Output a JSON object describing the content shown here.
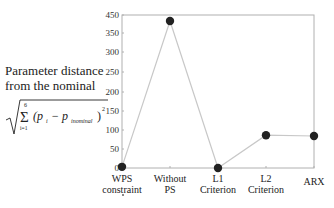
{
  "chart_data": {
    "type": "line",
    "title": "",
    "ylabel_line1": "Parameter distance",
    "ylabel_line2": "from the nominal",
    "ylabel_formula": "sqrt( sum_{i=1}^{6} (p_i - p_{i nominal})^2 )",
    "formula_parts": {
      "sum_top": "6",
      "sum_bottom": "i=1",
      "body": "(p",
      "sub_i": "i",
      "minus": " − p",
      "sub_nom": "inominal",
      "close": ")",
      "power": "2"
    },
    "xlabel": "",
    "categories": [
      "WPS constraint",
      "Without PS",
      "L1 Criterion",
      "L2 Criterion",
      "ARX"
    ],
    "category_lines": [
      [
        "WPS",
        "constraint"
      ],
      [
        "Without",
        "PS"
      ],
      [
        "L1",
        "Criterion"
      ],
      [
        "L2",
        "Criterion"
      ],
      [
        "ARX"
      ]
    ],
    "series": [
      {
        "name": "Parameter distance",
        "values": [
          3,
          381,
          0,
          85,
          83
        ]
      }
    ],
    "yticks": [
      "450",
      "350",
      "300",
      "250",
      "200",
      "150",
      "100",
      "50",
      "0"
    ],
    "ylim": [
      0,
      400
    ],
    "grid": false,
    "legend": "none",
    "colors": {
      "line": "#c8c8c8",
      "marker": "#222222",
      "axis": "#b0b0b0"
    }
  }
}
